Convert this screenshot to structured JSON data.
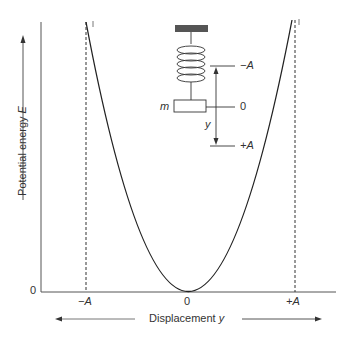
{
  "figure": {
    "y_axis_label": "Potential energy",
    "y_axis_symbol": "E",
    "x_axis_label": "Displacement",
    "x_axis_symbol": "y",
    "origin_label": "0",
    "x_ticks": [
      {
        "label": "−A",
        "pos": "minus-amplitude"
      },
      {
        "label": "0",
        "pos": "zero"
      },
      {
        "label": "+A",
        "pos": "plus-amplitude"
      }
    ],
    "curve": "parabola E ∝ y²",
    "inset": {
      "mass_label": "m",
      "displacement_label": "y",
      "levels": [
        "−A",
        "0",
        "+A"
      ]
    },
    "colors": {
      "line": "#333333",
      "axis": "#555555"
    }
  }
}
